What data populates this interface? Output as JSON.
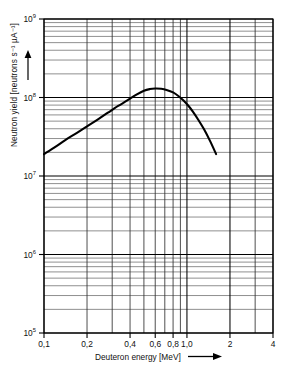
{
  "figure": {
    "background": "#ffffff",
    "line_color": "#000000",
    "grid_color": "#3a3a3a",
    "frame_color": "#000000"
  },
  "axes": {
    "x": {
      "label_text": "Deuteron energy [MeV]",
      "label_arrow": "⟶",
      "scale": "log",
      "min": 0.1,
      "max": 4,
      "tick_labels": [
        "0,1",
        "0,2",
        "0,4",
        "0,6",
        "0,8",
        "1,0",
        "2",
        "4"
      ],
      "tick_values": [
        0.1,
        0.2,
        0.4,
        0.6,
        0.8,
        1.0,
        2,
        4
      ],
      "minor_gridlines": [
        0.1,
        0.2,
        0.3,
        0.4,
        0.5,
        0.6,
        0.7,
        0.8,
        0.9,
        1.0,
        2,
        3,
        4
      ]
    },
    "y": {
      "label_text": "Neutron yield [neutrons s⁻¹ µA⁻¹]",
      "label_arrow": "↑",
      "scale": "log",
      "min": 100000,
      "max": 1000000000,
      "tick_labels": [
        "10",
        "10",
        "10",
        "10",
        "10"
      ],
      "tick_exponents": [
        "9",
        "8",
        "7",
        "6",
        "5"
      ],
      "tick_values": [
        1000000000,
        100000000,
        10000000,
        1000000,
        100000
      ]
    }
  },
  "chart_data": {
    "type": "line",
    "title": "",
    "subtitle": "",
    "xlabel": "Deuteron energy [MeV]",
    "ylabel": "Neutron yield [neutrons s⁻¹ µA⁻¹]",
    "xscale": "log",
    "yscale": "log",
    "xlim": [
      0.1,
      4
    ],
    "ylim": [
      100000,
      1000000000
    ],
    "grid": true,
    "legend": false,
    "legend_position": "none",
    "series": [
      {
        "name": "Neutron yield vs deuteron energy",
        "x": [
          0.1,
          0.12,
          0.14,
          0.17,
          0.2,
          0.24,
          0.28,
          0.33,
          0.38,
          0.44,
          0.5,
          0.55,
          0.6,
          0.66,
          0.72,
          0.8,
          0.88,
          0.95,
          1.02,
          1.1,
          1.2,
          1.32,
          1.45,
          1.6
        ],
        "y": [
          19000000.0,
          23500000.0,
          28500000.0,
          35500000.0,
          43000000.0,
          53000000.0,
          64000000.0,
          78000000.0,
          91000000.0,
          108000000.0,
          122000000.0,
          128000000.0,
          130000000.0,
          129000000.0,
          125000000.0,
          116000000.0,
          103000000.0,
          91000000.0,
          79000000.0,
          66000000.0,
          52000000.0,
          39000000.0,
          28000000.0,
          19000000.0
        ]
      }
    ],
    "annotations": []
  }
}
